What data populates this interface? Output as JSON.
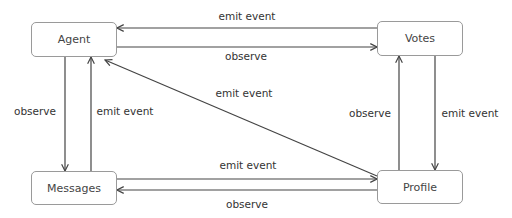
{
  "nodes": {
    "agent": {
      "label": "Agent"
    },
    "votes": {
      "label": "Votes"
    },
    "messages": {
      "label": "Messages"
    },
    "profile": {
      "label": "Profile"
    }
  },
  "edges": [
    {
      "from": "Votes",
      "to": "Agent",
      "label": "emit event"
    },
    {
      "from": "Agent",
      "to": "Votes",
      "label": "observe"
    },
    {
      "from": "Agent",
      "to": "Messages",
      "label": "observe"
    },
    {
      "from": "Messages",
      "to": "Agent",
      "label": "emit event"
    },
    {
      "from": "Profile",
      "to": "Agent",
      "label": "emit event"
    },
    {
      "from": "Profile",
      "to": "Votes",
      "label": "observe"
    },
    {
      "from": "Votes",
      "to": "Profile",
      "label": "emit event"
    },
    {
      "from": "Messages",
      "to": "Profile",
      "label": "emit event"
    },
    {
      "from": "Profile",
      "to": "Messages",
      "label": "observe"
    }
  ],
  "colors": {
    "line": "#444444",
    "border": "#9a9a9a"
  }
}
